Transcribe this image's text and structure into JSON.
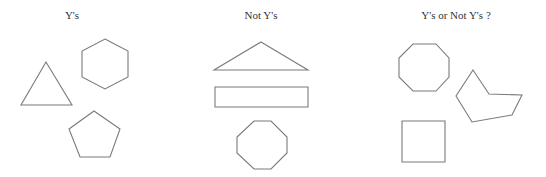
{
  "panels": [
    {
      "id": "ys",
      "title": "Y's",
      "title_x": 72,
      "shapes": [
        {
          "name": "triangle",
          "type": "polygon",
          "points": "46,62 72,105 21,105"
        },
        {
          "name": "hexagon",
          "type": "polygon",
          "points": "105,39 128,51 128,77 105,89 82,77 82,51"
        },
        {
          "name": "pentagon",
          "type": "polygon",
          "points": "94,111 120,129 110,157 80,157 69,129"
        }
      ]
    },
    {
      "id": "not-ys",
      "title": "Not Y's",
      "title_x": 261,
      "shapes": [
        {
          "name": "obtuse-triangle",
          "type": "polygon",
          "points": "261,42 308,70 214,70"
        },
        {
          "name": "rectangle",
          "type": "polygon",
          "points": "215,87 308,87 308,107 215,107"
        },
        {
          "name": "octagon",
          "type": "polygon",
          "points": "254,121 271,121 287,137 287,153 271,169 254,169 237,153 237,137"
        }
      ]
    },
    {
      "id": "ys-or-not-ys",
      "title": "Y's or Not Y's ?",
      "title_x": 456,
      "shapes": [
        {
          "name": "octagon",
          "type": "polygon",
          "points": "413,44 436,44 449,58 449,77 436,91 413,91 399,77 399,58"
        },
        {
          "name": "concave-pentagon",
          "type": "polygon",
          "points": "473,70 489,94 522,95 512,115 472,122 456,96"
        },
        {
          "name": "square",
          "type": "polygon",
          "points": "402,121 445,121 445,162 402,162"
        }
      ]
    }
  ],
  "colors": {
    "stroke": "#7a7a7a",
    "title": "#333333",
    "background": "#ffffff"
  }
}
